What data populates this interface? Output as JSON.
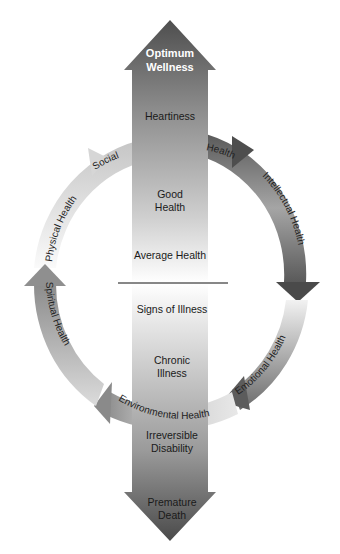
{
  "diagram": {
    "title_top": [
      "Optimum",
      "Wellness"
    ],
    "title_bottom": [
      "Premature",
      "Death"
    ],
    "axis_levels_upper": [
      {
        "id": "heartiness",
        "lines": [
          "Heartiness"
        ]
      },
      {
        "id": "good-health",
        "lines": [
          "Good",
          "Health"
        ]
      },
      {
        "id": "average-health",
        "lines": [
          "Average Health"
        ]
      }
    ],
    "axis_levels_lower": [
      {
        "id": "signs-of-illness",
        "lines": [
          "Signs of Illness"
        ]
      },
      {
        "id": "chronic-illness",
        "lines": [
          "Chronic",
          "Illness"
        ]
      },
      {
        "id": "irreversible-disability",
        "lines": [
          "Irreversible",
          "Disability"
        ]
      }
    ],
    "ring_segments": [
      {
        "id": "social-health",
        "label_a": "Social",
        "label_b": "Health"
      },
      {
        "id": "intellectual-health",
        "label": "Intellectual Health"
      },
      {
        "id": "emotional-health",
        "label": "Emotional Health"
      },
      {
        "id": "environmental-health",
        "label": "Environmental Health"
      },
      {
        "id": "spiritual-health",
        "label": "Spiritual Health"
      },
      {
        "id": "physical-health",
        "label": "Physical Health"
      }
    ],
    "colors": {
      "arrow_dark": "#4a4a4a",
      "arrow_mid": "#9a9a9a",
      "arrow_light": "#f2f2f2",
      "ring_dark": "#555555",
      "ring_light": "#eeeeee",
      "divider": "#111111"
    }
  }
}
